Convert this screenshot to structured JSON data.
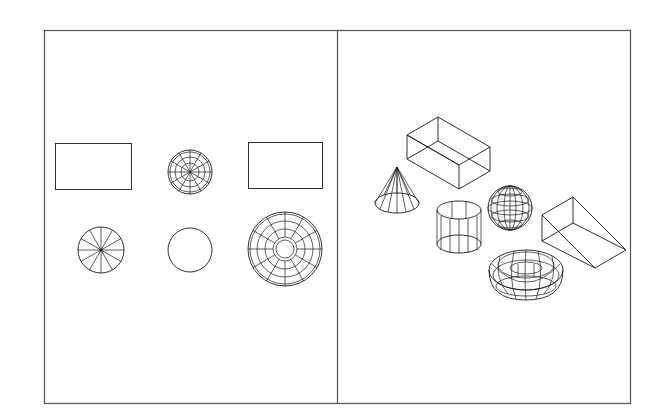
{
  "figure": {
    "panels": [
      {
        "id": "left",
        "view": "plan / top view",
        "objects": [
          {
            "name": "rectangle-top-left",
            "type": "box-top"
          },
          {
            "name": "sphere-top",
            "type": "sphere-top"
          },
          {
            "name": "rectangle-top-right",
            "type": "wedge-top"
          },
          {
            "name": "cone-top",
            "type": "cone-top"
          },
          {
            "name": "cylinder-top",
            "type": "cylinder-top"
          },
          {
            "name": "torus-top",
            "type": "torus-top"
          }
        ]
      },
      {
        "id": "right",
        "view": "isometric view",
        "objects": [
          {
            "name": "box-3d",
            "type": "box"
          },
          {
            "name": "cone-3d",
            "type": "cone"
          },
          {
            "name": "cylinder-3d",
            "type": "cylinder"
          },
          {
            "name": "sphere-3d",
            "type": "sphere"
          },
          {
            "name": "wedge-3d",
            "type": "wedge"
          },
          {
            "name": "torus-3d",
            "type": "torus"
          }
        ]
      }
    ],
    "colors": {
      "line": "#1a1a1a",
      "frame": "#555555",
      "background": "#ffffff"
    }
  }
}
